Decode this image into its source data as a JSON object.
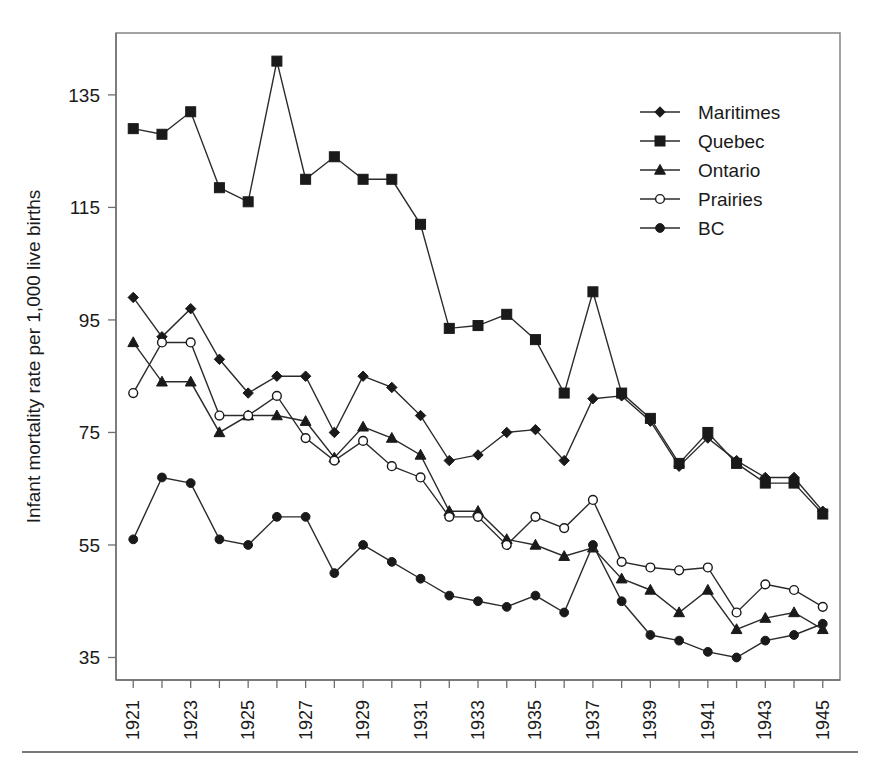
{
  "chart_data": {
    "type": "line",
    "title": "",
    "subtitle": "",
    "xlabel": "",
    "ylabel": "Infant mortality rate per 1,000 live births",
    "x": [
      1921,
      1922,
      1923,
      1924,
      1925,
      1926,
      1927,
      1928,
      1929,
      1930,
      1931,
      1932,
      1933,
      1934,
      1935,
      1936,
      1937,
      1938,
      1939,
      1940,
      1941,
      1942,
      1943,
      1944,
      1945
    ],
    "xtick_labels": [
      "1921",
      "1923",
      "1925",
      "1927",
      "1929",
      "1931",
      "1933",
      "1935",
      "1937",
      "1939",
      "1941",
      "1943",
      "1945"
    ],
    "xtick_values": [
      1921,
      1923,
      1925,
      1927,
      1929,
      1931,
      1933,
      1935,
      1937,
      1939,
      1941,
      1943,
      1945
    ],
    "ytick_labels": [
      "35",
      "55",
      "75",
      "95",
      "115",
      "135"
    ],
    "ytick_values": [
      35,
      55,
      75,
      95,
      115,
      135
    ],
    "xlim": [
      1920.4,
      1945.6
    ],
    "ylim": [
      31,
      146
    ],
    "grid": false,
    "legend_position": "top-right",
    "series": [
      {
        "name": "Maritimes",
        "marker": "diamond",
        "values": [
          99,
          92,
          97,
          88,
          82,
          85,
          85,
          75,
          85,
          83,
          78,
          70,
          71,
          75,
          75.5,
          70,
          81,
          81.5,
          77,
          69,
          74,
          70,
          67,
          67,
          61
        ]
      },
      {
        "name": "Quebec",
        "marker": "square-filled",
        "values": [
          129,
          128,
          132,
          118.5,
          116,
          141,
          120,
          124,
          120,
          120,
          112,
          93.5,
          94,
          96,
          91.5,
          82,
          100,
          82,
          77.5,
          69.5,
          75,
          69.5,
          66,
          66,
          60.5
        ]
      },
      {
        "name": "Ontario",
        "marker": "triangle",
        "values": [
          91,
          84,
          84,
          75,
          78,
          78,
          77,
          70.5,
          76,
          74,
          71,
          61,
          61,
          56,
          55,
          53,
          54.5,
          49,
          47,
          43,
          47,
          40,
          42,
          43,
          40
        ]
      },
      {
        "name": "Prairies",
        "marker": "circle-open",
        "values": [
          82,
          91,
          91,
          78,
          78,
          81.5,
          74,
          70,
          73.5,
          69,
          67,
          60,
          60,
          55,
          60,
          58,
          63,
          52,
          51,
          50.5,
          51,
          43,
          48,
          47,
          44
        ]
      },
      {
        "name": "BC",
        "marker": "circle-filled",
        "values": [
          56,
          67,
          66,
          56,
          55,
          60,
          60,
          50,
          55,
          52,
          49,
          46,
          45,
          44,
          46,
          43,
          55,
          45,
          39,
          38,
          36,
          35,
          38,
          39,
          41
        ]
      }
    ]
  },
  "legend": {
    "entries": [
      {
        "label": "Maritimes"
      },
      {
        "label": "Quebec"
      },
      {
        "label": "Ontario"
      },
      {
        "label": "Prairies"
      },
      {
        "label": "BC"
      }
    ]
  }
}
